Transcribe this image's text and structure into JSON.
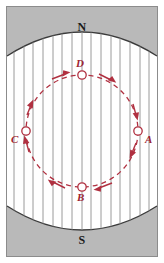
{
  "figure": {
    "name": "charged-particle-in-uniform-magnetic-field",
    "background": "#ffffff",
    "width": 164,
    "height": 263
  },
  "frame": {
    "border_color": "#8c8c8c",
    "border_width": 1
  },
  "magnet": {
    "fill": "#b9b9b9",
    "edge_color": "#3a3a3a",
    "north": {
      "label": "N",
      "position": "top",
      "x": 82,
      "y": 27
    },
    "south": {
      "label": "S",
      "position": "bottom",
      "x": 82,
      "y": 240
    }
  },
  "field": {
    "direction": "downward",
    "line_color": "#8e8e8e",
    "arrow_color": "#707070",
    "line_count": 15,
    "x_positions": [
      14,
      24,
      33,
      43,
      53,
      62,
      72,
      82,
      91,
      101,
      111,
      120,
      130,
      140,
      149
    ]
  },
  "orbit": {
    "type": "dashed-circle",
    "color": "#b03040",
    "center_x": 82,
    "center_y": 131,
    "radius": 56,
    "rotation": "clockwise",
    "dash": "5 4"
  },
  "points": [
    {
      "id": "D",
      "label": "D",
      "angle_deg": 90,
      "cx": 82,
      "cy": 75,
      "label_x": 77,
      "label_y": 59
    },
    {
      "id": "A",
      "label": "A",
      "angle_deg": 0,
      "cx": 138,
      "cy": 131,
      "label_x": 146,
      "label_y": 136
    },
    {
      "id": "B",
      "label": "B",
      "angle_deg": 270,
      "cx": 82,
      "cy": 187,
      "label_x": 78,
      "label_y": 192
    },
    {
      "id": "C",
      "label": "C",
      "angle_deg": 180,
      "cx": 26,
      "cy": 131,
      "label_x": 12,
      "label_y": 136
    }
  ],
  "colors": {
    "magnet_gray": "#b9b9b9",
    "field_gray": "#8e8e8e",
    "orbit_red": "#b03040",
    "label_red": "#9e2430",
    "text_black": "#1a1a1a"
  }
}
